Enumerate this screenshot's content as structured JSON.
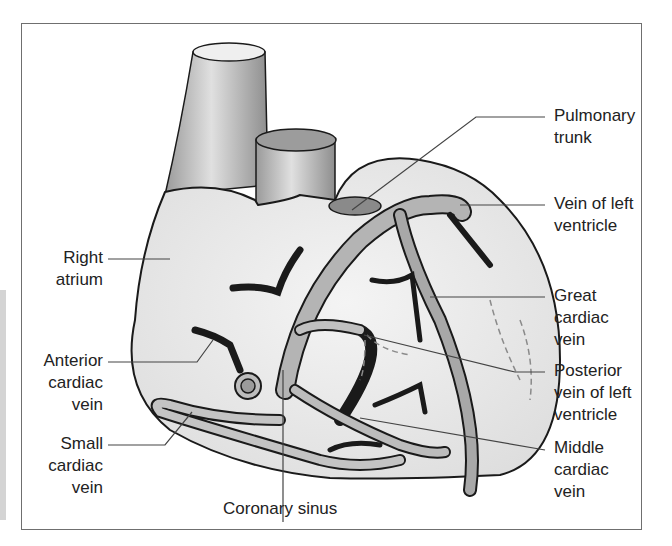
{
  "figure": {
    "labels": {
      "pulmonary_trunk": "Pulmonary\ntrunk",
      "vein_of_left_ventricle": "Vein of left\nventricle",
      "right_atrium": "Right\natrium",
      "great_cardiac_vein": "Great\ncardiac\nvein",
      "anterior_cardiac_vein": "Anterior\ncardiac\nvein",
      "posterior_vein_of_left_ventricle": "Posterior\nvein of left\nventricle",
      "small_cardiac_vein": "Small\ncardiac\nvein",
      "middle_cardiac_vein": "Middle\ncardiac\nvein",
      "coronary_sinus": "Coronary sinus"
    },
    "colors": {
      "outline": "#1a1a1a",
      "heart_fill": "#ececec",
      "vessel_fill": "#b8b8b8",
      "vein_fill": "#a9a9a9",
      "leader_line": "#444444",
      "frame": "#6f6f6f"
    }
  }
}
